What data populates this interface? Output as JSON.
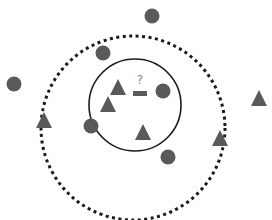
{
  "diagram": {
    "query_label": "?",
    "colors": {
      "shape_fill": "#5a5a5a",
      "inner_circle_stroke": "#1a1a1a",
      "outer_circle_stroke": "#1a1a1a",
      "query_label": "#888888",
      "background": "#ffffff"
    },
    "query_point": {
      "shape": "rectangle",
      "x": 140,
      "y": 93,
      "w": 13,
      "h": 5
    },
    "inner_circle": {
      "cx": 135,
      "cy": 105,
      "r": 46,
      "style": "solid"
    },
    "outer_circle": {
      "cx": 133,
      "cy": 128,
      "r": 92,
      "style": "dotted"
    },
    "points": [
      {
        "shape": "circle",
        "x": 152,
        "y": 16,
        "group": "class-circle"
      },
      {
        "shape": "circle",
        "x": 103,
        "y": 53,
        "group": "class-circle"
      },
      {
        "shape": "circle",
        "x": 14,
        "y": 84,
        "group": "class-circle"
      },
      {
        "shape": "circle",
        "x": 163,
        "y": 91,
        "group": "class-circle"
      },
      {
        "shape": "circle",
        "x": 91,
        "y": 126,
        "group": "class-circle"
      },
      {
        "shape": "circle",
        "x": 168,
        "y": 157,
        "group": "class-circle"
      },
      {
        "shape": "triangle",
        "x": 118,
        "y": 88,
        "group": "class-triangle"
      },
      {
        "shape": "triangle",
        "x": 108,
        "y": 105,
        "group": "class-triangle"
      },
      {
        "shape": "triangle",
        "x": 143,
        "y": 132,
        "group": "class-triangle"
      },
      {
        "shape": "triangle",
        "x": 44,
        "y": 121,
        "group": "class-triangle"
      },
      {
        "shape": "triangle",
        "x": 220,
        "y": 138,
        "group": "class-triangle"
      },
      {
        "shape": "triangle",
        "x": 259,
        "y": 99,
        "group": "class-triangle"
      }
    ]
  }
}
